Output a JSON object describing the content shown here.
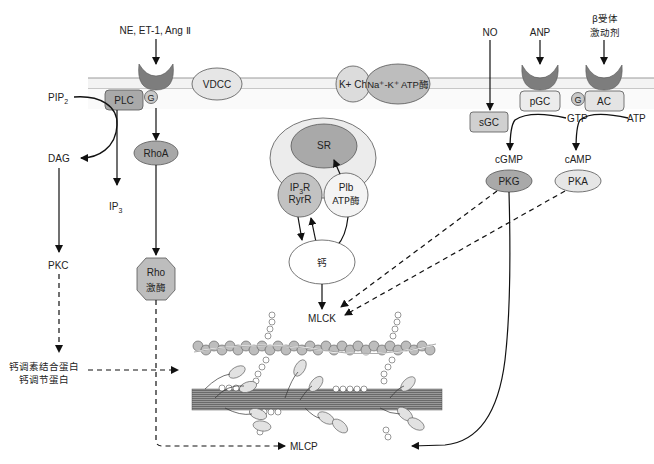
{
  "diagram": {
    "type": "signaling-pathway"
  },
  "labels": {
    "agonists_left": "NE, ET-1, Ang Ⅱ",
    "vdcc": "VDCC",
    "k_channel": "K+ Ch",
    "na_k_atpase": "Na⁺-K⁺ ATP酶",
    "no": "NO",
    "anp": "ANP",
    "beta_agonist_line1": "β受体",
    "beta_agonist_line2": "激动剂",
    "pip2": "PIP",
    "pip2_sub": "2",
    "plc": "PLC",
    "g_left": "G",
    "g_right": "G",
    "rhoa": "RhoA",
    "dag": "DAG",
    "ip3": "IP",
    "ip3_sub": "3",
    "pkc": "PKC",
    "rho_kinase_line1": "Rho",
    "rho_kinase_line2": "激酶",
    "sr": "SR",
    "ip3r_line1": "IP",
    "ip3r_sub": "3",
    "ip3r_line1_suffix": "R",
    "ip3r_line2": "RyrR",
    "plb_line1": "Plb",
    "plb_line2": "ATP酶",
    "calcium": "钙",
    "mlck": "MLCK",
    "mlcp": "MLCP",
    "pgc": "pGC",
    "ac": "AC",
    "sgc": "sGC",
    "gtp": "GTP",
    "atp": "ATP",
    "cgmp": "cGMP",
    "camp": "cAMP",
    "pkg": "PKG",
    "pka": "PKA",
    "calponin_line1": "钙调素结合蛋白",
    "calponin_line2": "钙调节蛋白"
  },
  "colors": {
    "receptor": "#7a7a7a",
    "dark_node": "#a8a8a8",
    "mid_node": "#c8c8c8",
    "light_node": "#e4e4e4",
    "membrane_band": "#f2f2f2",
    "line": "#111111"
  }
}
